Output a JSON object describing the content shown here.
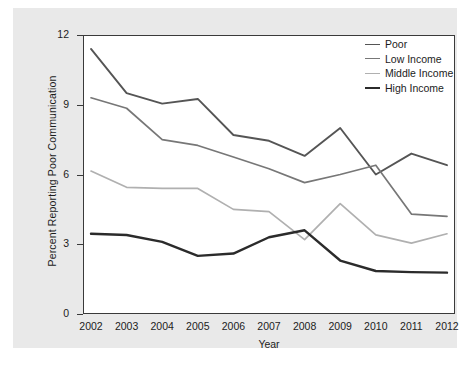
{
  "chart_data": {
    "type": "line",
    "title": "",
    "xlabel": "Year",
    "ylabel": "Percent Reporting Poor Communication",
    "categories": [
      "2002",
      "2003",
      "2004",
      "2005",
      "2006",
      "2007",
      "2008",
      "2009",
      "2010",
      "2011",
      "2012"
    ],
    "x": [
      2002,
      2003,
      2004,
      2005,
      2006,
      2007,
      2008,
      2009,
      2010,
      2011,
      2012
    ],
    "xlim": [
      2002,
      2012
    ],
    "ylim": [
      0,
      12
    ],
    "yticks": [
      0,
      3,
      6,
      9,
      12
    ],
    "ytick_labels": [
      "0",
      "3",
      "6",
      "9",
      "12"
    ],
    "grid": false,
    "legend_position": "top-right",
    "series": [
      {
        "name": "Poor",
        "color": "#555555",
        "linewidth": 1.9,
        "values": [
          11.4,
          9.5,
          9.05,
          9.25,
          7.7,
          7.45,
          6.8,
          8.0,
          6.0,
          6.9,
          6.4
        ]
      },
      {
        "name": "Low Income",
        "color": "#777777",
        "linewidth": 1.7,
        "values": [
          9.3,
          8.85,
          7.5,
          7.25,
          6.75,
          6.25,
          5.65,
          6.0,
          6.4,
          4.3,
          4.2
        ]
      },
      {
        "name": "Middle Income",
        "color": "#b0b0b0",
        "linewidth": 1.7,
        "values": [
          6.15,
          5.45,
          5.4,
          5.4,
          4.5,
          4.4,
          3.2,
          4.75,
          3.4,
          3.05,
          3.45
        ]
      },
      {
        "name": "High Income",
        "color": "#2b2b2b",
        "linewidth": 2.4,
        "values": [
          3.45,
          3.4,
          3.1,
          2.5,
          2.6,
          3.3,
          3.6,
          2.3,
          1.85,
          1.8,
          1.78
        ]
      }
    ]
  },
  "legend": {
    "entries": [
      {
        "label": "Poor"
      },
      {
        "label": "Low Income"
      },
      {
        "label": "Middle Income"
      },
      {
        "label": "High Income"
      }
    ]
  },
  "axis": {
    "y_title": "Percent Reporting Poor Communication",
    "x_title": "Year"
  },
  "colors": {
    "panel_background": "#e9e9e9",
    "plot_background": "#ffffff",
    "frame": "#3a3a3a",
    "text": "#1c1c1c"
  },
  "caption": {
    "text": ""
  }
}
